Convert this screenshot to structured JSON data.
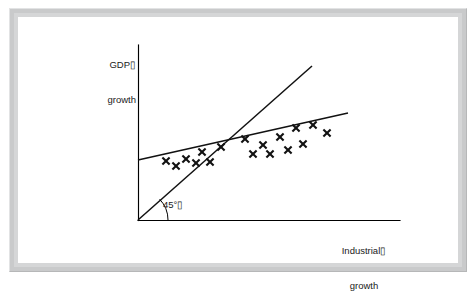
{
  "figure": {
    "kind": "economics-scatter-diagram",
    "frame_color": "#c9cacb",
    "panel_color": "#ffffff",
    "ink_color": "#111111"
  },
  "labels": {
    "y_axis_line1": "GDP▯",
    "y_axis_line2": "growth",
    "x_axis_line1": "Industrial▯",
    "x_axis_line2": "growth",
    "angle": "45°▯"
  },
  "chart_data": {
    "type": "scatter",
    "title": "",
    "subtitle": "",
    "xlabel": "Industrial growth",
    "ylabel": "GDP growth",
    "xlim": [
      0,
      100
    ],
    "ylim": [
      0,
      100
    ],
    "grid": false,
    "legend": "none",
    "axes": {
      "origin_px": [
        138,
        220
      ],
      "y_axis_top_px": [
        138,
        45
      ],
      "x_axis_right_px": [
        400,
        220
      ],
      "arrowheads": false,
      "ticks": false,
      "tick_labels": []
    },
    "annotations": [
      {
        "name": "angle-annotation",
        "text": "45°",
        "describes": "reference-line",
        "arc_radius_px": 30,
        "arc_start_deg": 0,
        "arc_end_deg": 45
      }
    ],
    "series": [
      {
        "name": "observations",
        "type": "scatter",
        "marker": "x",
        "color": "#111111",
        "points_px": [
          [
            166,
            161
          ],
          [
            176,
            166
          ],
          [
            186,
            159
          ],
          [
            196,
            163
          ],
          [
            202,
            152
          ],
          [
            210,
            162
          ],
          [
            221,
            147
          ],
          [
            245,
            139
          ],
          [
            253,
            154
          ],
          [
            263,
            145
          ],
          [
            270,
            154
          ],
          [
            280,
            137
          ],
          [
            288,
            150
          ],
          [
            296,
            128
          ],
          [
            303,
            144
          ],
          [
            313,
            125
          ],
          [
            327,
            133
          ]
        ],
        "count": 17
      },
      {
        "name": "45-degree-reference-line",
        "type": "line",
        "color": "#111111",
        "line_px": [
          [
            138,
            220
          ],
          [
            312,
            66
          ]
        ],
        "slope_description": "45 degree line (unit slope)"
      },
      {
        "name": "fitted-regression-line",
        "type": "line",
        "color": "#111111",
        "line_px": [
          [
            138,
            160
          ],
          [
            348,
            113
          ]
        ],
        "slope_description": "shallow positive slope, flatter than the 45 degree line"
      }
    ]
  }
}
